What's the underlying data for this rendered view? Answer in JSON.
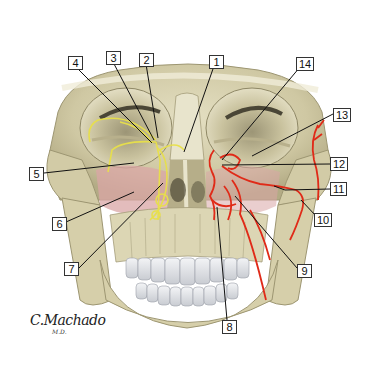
{
  "figure": {
    "colors": {
      "bone": "#d8d2b0",
      "bone_shadow": "#a9a27c",
      "nerve": "#e8e04a",
      "artery": "#e02a18",
      "mucosa": "#d9a6a6",
      "teeth": "#e6e8ea",
      "leader_line": "#111111",
      "background": "#ffffff"
    },
    "labels": [
      {
        "id": "1",
        "text": "1",
        "x": 209,
        "y": 55,
        "target_x": 184,
        "target_y": 152
      },
      {
        "id": "2",
        "text": "2",
        "x": 139,
        "y": 53,
        "target_x": 158,
        "target_y": 138
      },
      {
        "id": "3",
        "text": "3",
        "x": 106,
        "y": 51,
        "target_x": 154,
        "target_y": 140
      },
      {
        "id": "4",
        "text": "4",
        "x": 68,
        "y": 56,
        "target_x": 152,
        "target_y": 143
      },
      {
        "id": "5",
        "text": "5",
        "x": 29,
        "y": 167,
        "target_x": 134,
        "target_y": 163
      },
      {
        "id": "6",
        "text": "6",
        "x": 52,
        "y": 217,
        "target_x": 134,
        "target_y": 192
      },
      {
        "id": "7",
        "text": "7",
        "x": 64,
        "y": 265,
        "target_x": 163,
        "target_y": 183
      },
      {
        "id": "8",
        "text": "8",
        "x": 222,
        "y": 320,
        "target_x": 217,
        "target_y": 207
      },
      {
        "id": "9",
        "text": "9",
        "x": 297,
        "y": 265,
        "target_x": 235,
        "target_y": 196
      },
      {
        "id": "10",
        "text": "10",
        "x": 315,
        "y": 214,
        "target_x": 301,
        "target_y": 200
      },
      {
        "id": "11",
        "text": "11",
        "x": 330,
        "y": 183,
        "target_x": 274,
        "target_y": 186
      },
      {
        "id": "12",
        "text": "12",
        "x": 330,
        "y": 158,
        "target_x": 222,
        "target_y": 165
      },
      {
        "id": "13",
        "text": "13",
        "x": 333,
        "y": 108,
        "target_x": 252,
        "target_y": 156
      },
      {
        "id": "14",
        "text": "14",
        "x": 296,
        "y": 57,
        "target_x": 222,
        "target_y": 160
      }
    ],
    "signature": "C.Machado",
    "signature_sub": "M.D."
  }
}
